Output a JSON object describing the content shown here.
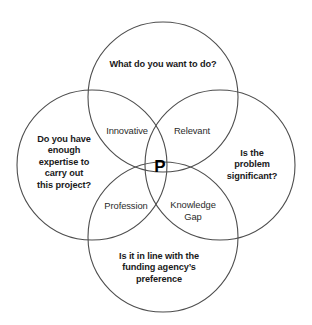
{
  "diagram": {
    "title_text": "",
    "background_color": "#ffffff",
    "stroke_color": "#4d4d4d",
    "text_color": "#1a1a1a",
    "circles": [
      {
        "name": "top",
        "cx": 163,
        "cy": 97,
        "r": 75
      },
      {
        "name": "left",
        "cx": 92,
        "cy": 165,
        "r": 75
      },
      {
        "name": "right",
        "cx": 220,
        "cy": 165,
        "r": 75
      },
      {
        "name": "bottom",
        "cx": 163,
        "cy": 237,
        "r": 75
      }
    ],
    "outer_labels": [
      {
        "id": "top",
        "text": "What do you want to do?",
        "x": 163,
        "y": 65
      },
      {
        "id": "left",
        "text": "Do you have\nenough\nexpertise to\ncarry out\nthis project?",
        "x": 64,
        "y": 163
      },
      {
        "id": "right",
        "text": "Is the\nproblem\nsignificant?",
        "x": 252,
        "y": 165
      },
      {
        "id": "bottom",
        "text": "Is it in line with the\nfunding agency’s\npreference",
        "x": 159,
        "y": 268
      }
    ],
    "inner_labels": [
      {
        "id": "innovative",
        "text": "Innovative",
        "x": 127,
        "y": 131
      },
      {
        "id": "relevant",
        "text": "Relevant",
        "x": 192,
        "y": 131
      },
      {
        "id": "profession",
        "text": "Profession",
        "x": 126,
        "y": 206
      },
      {
        "id": "knowledge-gap",
        "text": "Knowledge\nGap",
        "x": 193,
        "y": 211
      }
    ],
    "center_label": {
      "id": "center",
      "text": "P",
      "x": 160,
      "y": 166
    }
  }
}
